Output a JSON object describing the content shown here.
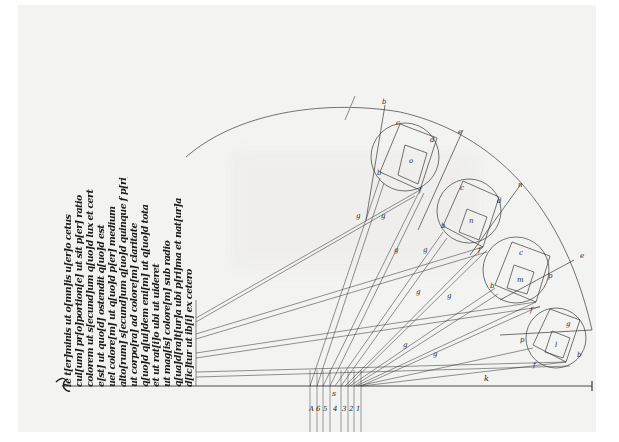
{
  "diagram": {
    "type": "medieval-manuscript-optics-diagram",
    "text_column": {
      "orientation": "rotated-90",
      "lines": [
        "le t[er]minis ut o[mn]is u[er]o cetus",
        "cul[um] pr[o]portion[e] ut sit p[er] ratio",
        "colorem ut s[ecund]um q[uo]d lux et cert",
        "e[st] ut quo[d] ostendit q[uo]d est",
        "uel colore[m] ut q[uo]d p[er] medium",
        "alto[rum] s[ecund]um q[uo]d quinque f p[ri]mo",
        "ut corpo[ra] ad colore[m] claritate",
        "q[uo]d q[ui]dem eni[m] ut q[uo]d tota",
        "et ut rat[i]o ubi ut uideret",
        "ut mag[is] colore[m] sub radio",
        "q[ua]d[ra]t[ur]a ubi p[ri]ma et nat[ur]a",
        "d[ic]tur ut ib[i] ex cetero"
      ]
    },
    "baseline": {
      "label_end": "k",
      "label_mid": "s",
      "point_labels": [
        "A",
        "6",
        "5",
        "4",
        "3",
        "2",
        "1"
      ]
    },
    "circles": [
      {
        "name": "circle-o",
        "center_label": "o",
        "edge_labels": [
          "c",
          "d",
          "b",
          "f"
        ],
        "tip_label": "b"
      },
      {
        "name": "circle-n",
        "center_label": "n",
        "edge_labels": [
          "c",
          "d",
          "b",
          "f"
        ],
        "tip_label": "e"
      },
      {
        "name": "circle-m",
        "center_label": "m",
        "edge_labels": [
          "c",
          "p",
          "b",
          "f"
        ],
        "tip_label": "n"
      },
      {
        "name": "circle-l",
        "center_label": "l",
        "edge_labels": [
          "g",
          "p",
          "b",
          "f"
        ],
        "tip_label": "e"
      }
    ],
    "line_markers": [
      "g",
      "g",
      "g",
      "g",
      "g",
      "g",
      "g",
      "g"
    ],
    "colors": {
      "paper": "#f3f3f2",
      "ink": "#2a2a2a",
      "background": "#ffffff"
    }
  }
}
